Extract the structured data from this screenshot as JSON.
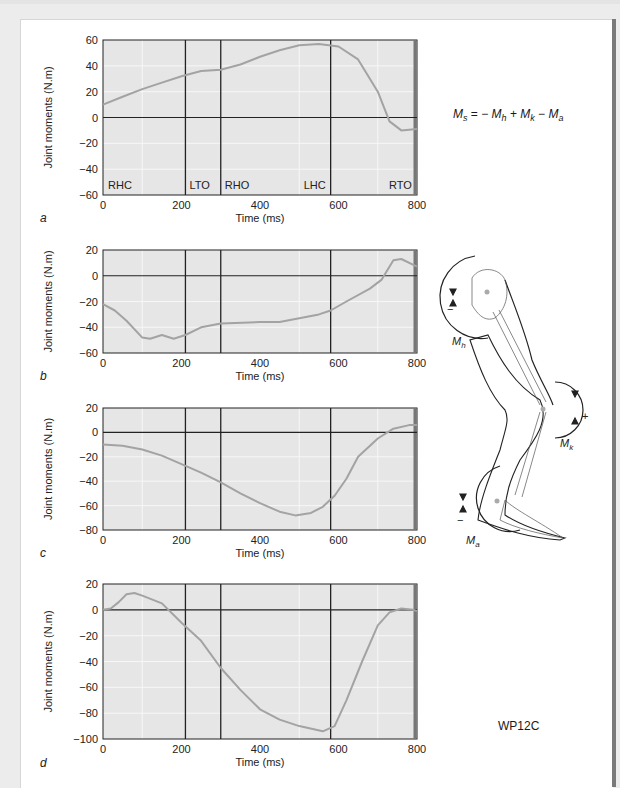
{
  "figure": {
    "formula": {
      "lhs": "M",
      "lhs_sub": "s",
      "terms": [
        {
          "op": "= −",
          "sym": "M",
          "sub": "h"
        },
        {
          "op": "+",
          "sym": "M",
          "sub": "k"
        },
        {
          "op": "−",
          "sym": "M",
          "sub": "a"
        }
      ]
    },
    "code": "WP12C",
    "leg_labels": {
      "hip": "Mh",
      "knee": "Mk",
      "ankle": "Ma",
      "hip_sign": "−",
      "knee_sign": "+",
      "ankle_sign": "−"
    }
  },
  "chart_data": [
    {
      "type": "line",
      "panel": "a",
      "xlabel": "Time (ms)",
      "ylabel": "Joint moments (N.m)",
      "xlim": [
        0,
        800
      ],
      "ylim": [
        -60,
        60
      ],
      "xticks": [
        0,
        200,
        400,
        600,
        800
      ],
      "yticks": [
        60,
        40,
        20,
        0,
        -20,
        -40,
        -60
      ],
      "events": [
        {
          "label": "RHC",
          "x": 0
        },
        {
          "label": "LTO",
          "x": 210
        },
        {
          "label": "RHO",
          "x": 300
        },
        {
          "label": "LHC",
          "x": 580
        },
        {
          "label": "RTO",
          "x": 795
        }
      ],
      "series": [
        {
          "name": "Ms (support moment)",
          "x": [
            0,
            50,
            100,
            150,
            200,
            250,
            300,
            350,
            400,
            450,
            500,
            550,
            600,
            650,
            700,
            730,
            760,
            800
          ],
          "y": [
            10,
            16,
            22,
            27,
            32,
            36,
            37,
            41,
            47,
            52,
            56,
            57,
            55,
            45,
            20,
            -3,
            -10,
            -9
          ]
        }
      ]
    },
    {
      "type": "line",
      "panel": "b",
      "xlabel": "Time (ms)",
      "ylabel": "Joint moments (N.m)",
      "xlim": [
        0,
        800
      ],
      "ylim": [
        -60,
        20
      ],
      "xticks": [
        0,
        200,
        400,
        600,
        800
      ],
      "yticks": [
        20,
        0,
        -20,
        -40,
        -60
      ],
      "events": [
        {
          "x": 210
        },
        {
          "x": 300
        },
        {
          "x": 580
        },
        {
          "x": 795
        }
      ],
      "series": [
        {
          "name": "Mh (hip moment)",
          "x": [
            0,
            30,
            60,
            100,
            120,
            150,
            180,
            210,
            250,
            300,
            400,
            450,
            500,
            550,
            580,
            620,
            680,
            710,
            740,
            760,
            800
          ],
          "y": [
            -22,
            -27,
            -35,
            -48,
            -49,
            -46,
            -49,
            -46,
            -40,
            -37,
            -36,
            -36,
            -33,
            -30,
            -27,
            -20,
            -10,
            -3,
            12,
            13,
            7
          ]
        }
      ]
    },
    {
      "type": "line",
      "panel": "c",
      "xlabel": "Time (ms)",
      "ylabel": "Joint moments (N.m)",
      "xlim": [
        0,
        800
      ],
      "ylim": [
        -80,
        20
      ],
      "xticks": [
        0,
        200,
        400,
        600,
        800
      ],
      "yticks": [
        20,
        0,
        -20,
        -40,
        -60,
        -80
      ],
      "events": [
        {
          "x": 210
        },
        {
          "x": 300
        },
        {
          "x": 580
        },
        {
          "x": 795
        }
      ],
      "series": [
        {
          "name": "Mk (knee moment)",
          "x": [
            0,
            50,
            100,
            150,
            200,
            250,
            300,
            350,
            400,
            450,
            490,
            530,
            560,
            590,
            620,
            650,
            700,
            740,
            780,
            800
          ],
          "y": [
            -10,
            -11,
            -14,
            -19,
            -26,
            -33,
            -41,
            -50,
            -58,
            -65,
            -68,
            -66,
            -61,
            -52,
            -38,
            -20,
            -5,
            3,
            6,
            6
          ]
        }
      ]
    },
    {
      "type": "line",
      "panel": "d",
      "xlabel": "Time (ms)",
      "ylabel": "Joint moments (N.m)",
      "xlim": [
        0,
        800
      ],
      "ylim": [
        -100,
        20
      ],
      "xticks": [
        0,
        200,
        400,
        600,
        800
      ],
      "yticks": [
        20,
        0,
        -20,
        -40,
        -60,
        -80,
        -100
      ],
      "events": [
        {
          "x": 210
        },
        {
          "x": 300
        },
        {
          "x": 580
        },
        {
          "x": 795
        }
      ],
      "series": [
        {
          "name": "Ma (ankle moment)",
          "x": [
            0,
            20,
            40,
            60,
            80,
            100,
            150,
            200,
            250,
            300,
            350,
            400,
            450,
            500,
            560,
            590,
            620,
            660,
            700,
            730,
            760,
            790,
            800
          ],
          "y": [
            0,
            1,
            6,
            12,
            13,
            11,
            5,
            -10,
            -24,
            -45,
            -62,
            -77,
            -85,
            -90,
            -94,
            -90,
            -70,
            -40,
            -12,
            -2,
            1,
            0,
            -1
          ]
        }
      ]
    }
  ],
  "panels_layout": [
    {
      "top": 40,
      "bottom": 195,
      "label_y": 222
    },
    {
      "top": 250,
      "bottom": 353,
      "label_y": 380
    },
    {
      "top": 408,
      "bottom": 530,
      "label_y": 557
    },
    {
      "top": 584,
      "bottom": 739,
      "label_y": 767
    }
  ],
  "colors": {
    "plot_bg": "#e6e6e6",
    "grid": "#f7f7f7",
    "curve": "#a3a3a3",
    "axis": "#222222"
  }
}
